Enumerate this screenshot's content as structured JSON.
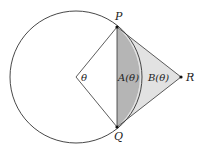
{
  "diagram": {
    "labels": {
      "P": "P",
      "Q": "Q",
      "R": "R",
      "theta": "θ",
      "A": "A(θ)",
      "B": "B(θ)"
    },
    "colors": {
      "stroke": "#333333",
      "segment_fill": "#b5b5b5",
      "triangle_fill": "#e2e2e2",
      "background": "#ffffff"
    }
  }
}
